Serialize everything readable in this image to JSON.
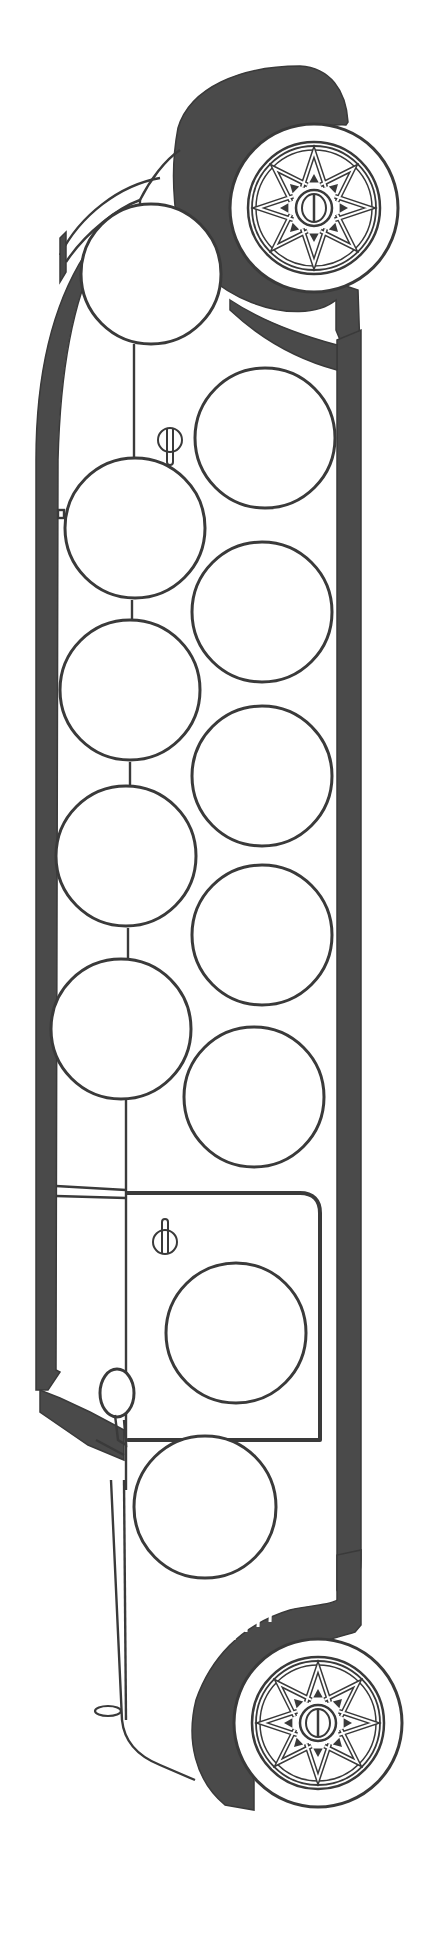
{
  "page": {
    "background": "#ffffff"
  },
  "colors": {
    "ink": "#3a3a3a",
    "shade": "#4a4a4a",
    "paper": "#ffffff"
  },
  "body": {
    "left_stripe_x": [
      36,
      56
    ],
    "right_stripe_x": [
      337,
      361
    ],
    "top_y": 150,
    "bottom_y": 1700
  },
  "windows": {
    "left_column": [
      {
        "cx": 151,
        "cy": 274,
        "r": 70
      },
      {
        "cx": 135,
        "cy": 528,
        "r": 70
      },
      {
        "cx": 130,
        "cy": 690,
        "r": 70
      },
      {
        "cx": 126,
        "cy": 856,
        "r": 70
      },
      {
        "cx": 121,
        "cy": 1029,
        "r": 70
      }
    ],
    "right_column": [
      {
        "cx": 265,
        "cy": 438,
        "r": 70
      },
      {
        "cx": 262,
        "cy": 612,
        "r": 70
      },
      {
        "cx": 262,
        "cy": 776,
        "r": 70
      },
      {
        "cx": 262,
        "cy": 935,
        "r": 70
      },
      {
        "cx": 254,
        "cy": 1097,
        "r": 70
      }
    ],
    "door_window": {
      "cx": 236,
      "cy": 1333,
      "r": 70
    },
    "front_window": {
      "cx": 205,
      "cy": 1507,
      "r": 71
    }
  },
  "wheels": [
    {
      "name": "rear-wheel",
      "cx": 314,
      "cy": 208,
      "r_tire": 84,
      "r_rim": 66,
      "r_hub": 18
    },
    {
      "name": "front-wheel",
      "cx": 318,
      "cy": 1723,
      "r_tire": 84,
      "r_rim": 66,
      "r_hub": 18
    }
  ],
  "details": {
    "rear_door_handle": {
      "x": 170,
      "y": 440
    },
    "front_door_handle": {
      "x": 165,
      "y": 1240
    },
    "mirror": {
      "x": 117,
      "y": 1408
    },
    "bumper_tab": {
      "x": 104,
      "y": 1710
    },
    "grille_slats": 4
  }
}
